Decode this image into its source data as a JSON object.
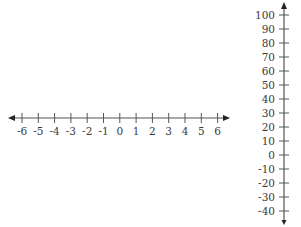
{
  "horizontal_number_line": {
    "min": -6,
    "max": 6,
    "step": 1,
    "tick_labels": [
      "-6",
      "-5",
      "-4",
      "-3",
      "-2",
      "-1",
      "0",
      "1",
      "2",
      "3",
      "4",
      "5",
      "6"
    ],
    "arrows": "both"
  },
  "vertical_number_line": {
    "min": -40,
    "max": 100,
    "step": 10,
    "tick_labels": [
      "100",
      "90",
      "80",
      "70",
      "60",
      "50",
      "40",
      "30",
      "20",
      "10",
      "0",
      "-10",
      "-20",
      "-30",
      "-40"
    ],
    "arrows": "both"
  },
  "colors": {
    "line": "#555555",
    "text": "#3a3a3a",
    "background": "#ffffff"
  }
}
